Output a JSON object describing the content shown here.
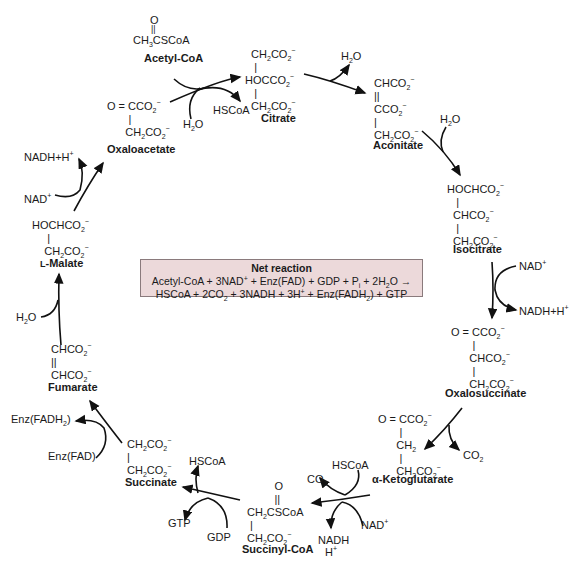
{
  "diagram": {
    "compounds": {
      "acetyl_coa": {
        "name": "Acetyl-CoA",
        "formula_top": "O",
        "formula_main": "CH3CSCoA"
      },
      "citrate": {
        "name": "Citrate",
        "lines": [
          "CH2CO2−",
          "HOCCO2−",
          "CH2CO2−"
        ]
      },
      "aconitate": {
        "name": "Aconitate",
        "lines": [
          "CHCO2−",
          "CCO2−",
          "CH2CO2−"
        ]
      },
      "isocitrate": {
        "name": "Isocitrate",
        "lines": [
          "HOCHCO2−",
          "CHCO2−",
          "CH2CO2−"
        ]
      },
      "oxalosuccinate": {
        "name": "Oxalosuccinate",
        "lines": [
          "O=CCO2−",
          "CHCO2−",
          "CH2CO2−"
        ]
      },
      "alpha_ketoglutarate": {
        "name": "α-Ketoglutarate",
        "lines": [
          "O=CCO2−",
          "CH2",
          "CH2CO2−"
        ]
      },
      "succinyl_coa": {
        "name": "Succinyl-CoA",
        "lines": [
          "O",
          "CH2CSCoA",
          "CH2CO2−"
        ]
      },
      "succinate": {
        "name": "Succinate",
        "lines": [
          "CH2CO2−",
          "CH2CO2−"
        ]
      },
      "fumarate": {
        "name": "Fumarate",
        "lines": [
          "CHCO2−",
          "CHCO2−"
        ]
      },
      "l_malate": {
        "name": "L-Malate",
        "lines": [
          "HOCHCO2−",
          "CH2CO2−"
        ]
      },
      "oxaloacetate": {
        "name": "Oxaloacetate",
        "lines": [
          "O=CCO2−",
          "CH2CO2−"
        ]
      }
    },
    "cofactors": {
      "citrate_in_h2o": "H2O",
      "citrate_out_hscoa": "HSCoA",
      "aconitate_out_h2o": "H2O",
      "isocitrate_in_h2o": "H2O",
      "isocitrate_nad": "NAD+",
      "isocitrate_nadh": "NADH+H+",
      "oxalosuccinate_co2": "CO2",
      "akg_hscoa": "HSCoA",
      "akg_co2": "CO2",
      "akg_nad": "NAD+",
      "akg_nadh": "NADH",
      "akg_h": "H+",
      "succ_hscoa": "HSCoA",
      "succ_gtp": "GTP",
      "succ_gdp": "GDP",
      "succinate_fad": "Enz(FAD)",
      "succinate_fadh2": "Enz(FADH2)",
      "fumarate_h2o": "H2O",
      "malate_nad": "NAD+",
      "malate_nadh": "NADH+H+"
    },
    "net_reaction": {
      "title": "Net reaction",
      "line1": "Acetyl-CoA + 3NAD+ + Enz(FAD) + GDP + Pi + 2H2O →",
      "line2": "HSCoA + 2CO2 + 3NADH + 3H+ + Enz(FADH2) + GTP",
      "box_color": "#ecd9da",
      "border_color": "#8a7a7c"
    }
  }
}
